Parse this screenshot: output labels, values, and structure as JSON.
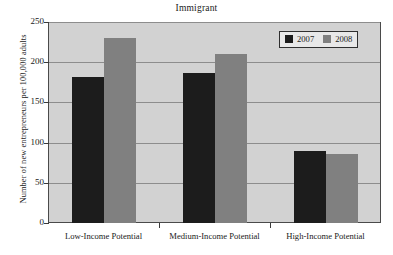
{
  "chart_data": {
    "type": "bar",
    "title": "Immigrant",
    "xlabel": "",
    "ylabel": "Number of new entrepreneurs per 100,000 adults",
    "categories": [
      "Low-Income Potential",
      "Medium-Income Potential",
      "High-Income Potential"
    ],
    "series": [
      {
        "name": "2007",
        "color": "#1c1c1c",
        "values": [
          182,
          187,
          90
        ]
      },
      {
        "name": "2008",
        "color": "#808080",
        "values": [
          230,
          210,
          86
        ]
      }
    ],
    "ylim": [
      0,
      250
    ],
    "yticks": [
      0,
      50,
      100,
      150,
      200,
      250
    ],
    "ytick_labels": [
      "0",
      "50",
      "100",
      "150",
      "200",
      "250"
    ],
    "grid": true,
    "grid_axis": "y",
    "legend_position": "top-right",
    "plot_background": "#d2d2d2",
    "figure_background": "#ffffff"
  },
  "legend": {
    "entries": [
      {
        "label": "2007"
      },
      {
        "label": "2008"
      }
    ]
  }
}
